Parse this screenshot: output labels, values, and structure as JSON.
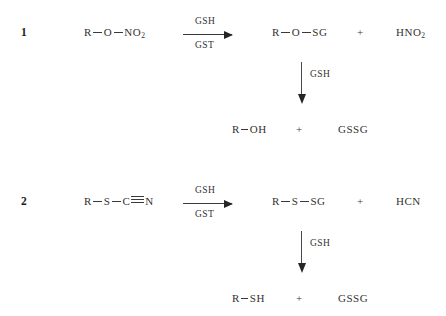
{
  "figure": {
    "background": "#ffffff",
    "ink_color": "#33322f"
  },
  "reactions": [
    {
      "number": "1",
      "reactant": {
        "prefix": "R",
        "mid": "O",
        "suffix": "NO",
        "suffix_sub": "2",
        "plain": "R-O-NO2"
      },
      "arrow": {
        "above": "GSH",
        "below": "GST"
      },
      "products": [
        {
          "prefix": "R",
          "mid": "O",
          "suffix": "SG",
          "plain": "R-O-SG"
        },
        {
          "plain": "HNO2",
          "text": "HNO",
          "sub": "2"
        }
      ],
      "plus": "+",
      "second_step": {
        "arrow_label": "GSH",
        "products": [
          {
            "prefix": "R",
            "suffix": "OH",
            "plain": "R-OH"
          },
          {
            "plain": "GSSG"
          }
        ],
        "plus": "+"
      }
    },
    {
      "number": "2",
      "reactant": {
        "prefix": "R",
        "mid": "S",
        "tail_atom": "C",
        "tail_end": "N",
        "plain": "R-S-C#N"
      },
      "arrow": {
        "above": "GSH",
        "below": "GST"
      },
      "products": [
        {
          "prefix": "R",
          "mid": "S",
          "suffix": "SG",
          "plain": "R-S-SG"
        },
        {
          "plain": "HCN"
        }
      ],
      "plus": "+",
      "second_step": {
        "arrow_label": "GSH",
        "products": [
          {
            "prefix": "R",
            "suffix": "SH",
            "plain": "R-SH"
          },
          {
            "plain": "GSSG"
          }
        ],
        "plus": "+"
      }
    }
  ]
}
